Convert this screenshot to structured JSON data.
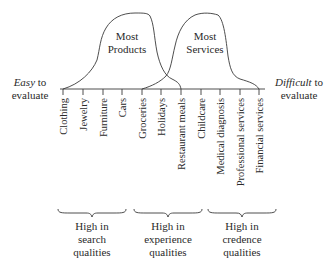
{
  "diagram": {
    "left_end": {
      "emphasis": "Easy",
      "rest": " to",
      "line2": "evaluate"
    },
    "right_end": {
      "emphasis": "Difficult",
      "rest": " to",
      "line2": "evaluate"
    },
    "curves": [
      {
        "name": "products",
        "line1": "Most",
        "line2": "Products"
      },
      {
        "name": "services",
        "line1": "Most",
        "line2": "Services"
      }
    ],
    "items": [
      "Clothing",
      "Jewelry",
      "Furniture",
      "Cars",
      "Groceries",
      "Holidays",
      "Restaurant meals",
      "Childcare",
      "Medical diagnosis",
      "Professional services",
      "Financial services"
    ],
    "groups": [
      {
        "line1": "High in",
        "line2": "search",
        "line3": "qualities"
      },
      {
        "line1": "High in",
        "line2": "experience",
        "line3": "qualities"
      },
      {
        "line1": "High in",
        "line2": "credence",
        "line3": "qualities"
      }
    ]
  }
}
